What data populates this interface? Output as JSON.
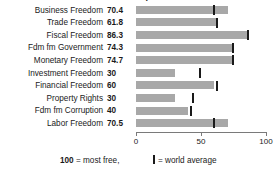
{
  "chart_data": {
    "type": "bar",
    "orientation": "horizontal",
    "title": "Index of Economic Freedom components",
    "categories": [
      "Business Freedom",
      "Trade Freedom",
      "Fiscal Freedom",
      "Fdm fm Government",
      "Monetary Freedom",
      "Investment Freedom",
      "Financial Freedom",
      "Property Rights",
      "Fdm fm Corruption",
      "Labor Freedom"
    ],
    "values": [
      70.4,
      61.8,
      86.3,
      74.3,
      74.7,
      30,
      60,
      30,
      40,
      70.5
    ],
    "value_labels": [
      "70.4",
      "61.8",
      "86.3",
      "74.3",
      "74.7",
      "30",
      "60",
      "30",
      "40",
      "70.5"
    ],
    "world_average": [
      59.8,
      62.0,
      86.3,
      74.3,
      74.7,
      49.5,
      62.0,
      44.0,
      42.0,
      60.0
    ],
    "series": [
      {
        "name": "Country score",
        "values": [
          70.4,
          61.8,
          86.3,
          74.3,
          74.7,
          30,
          60,
          30,
          40,
          70.5
        ]
      },
      {
        "name": "World average",
        "values": [
          59.8,
          62.0,
          86.3,
          74.3,
          74.7,
          49.5,
          62.0,
          44.0,
          42.0,
          60.0
        ]
      }
    ],
    "xlabel": "",
    "ylabel": "",
    "xlim": [
      0,
      100
    ],
    "xticks": [
      0,
      50,
      100
    ],
    "xtick_labels": [
      "0",
      "50",
      "100"
    ],
    "grid": false,
    "legend_position": "bottom",
    "bar_color": "#a8a8a8",
    "marker_color": "#1a1a1a"
  },
  "legend": {
    "most_free_value": "100",
    "most_free_text": " = most free,",
    "world_average_text": "= world average"
  }
}
